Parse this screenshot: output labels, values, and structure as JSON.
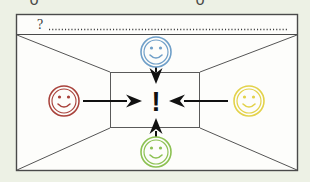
{
  "canvas": {
    "width": 310,
    "height": 182,
    "background_color": "#edf1e5",
    "paper_color": "#fdfdfb"
  },
  "diagram": {
    "title_fragment": "o    o",
    "type": "one-point-perspective-room",
    "frame": {
      "stroke_color": "#4a4a4a",
      "x": 16,
      "y": 14,
      "width": 282,
      "height": 157
    },
    "header_band": {
      "name": "question-header-band",
      "question_mark": "?",
      "dotted_line_char": ".",
      "dotted_line": "...........................................................................................",
      "y": 34
    },
    "inner_rect": {
      "x": 110,
      "y": 72,
      "width": 90,
      "height": 56,
      "stroke_color": "#5a5a5a"
    },
    "center_symbol": {
      "label": "!",
      "color": "#111111",
      "name": "exclamation-mark"
    },
    "faces": [
      {
        "id": "face-left",
        "position": "left",
        "color": "#a8413a",
        "label": "!",
        "cx": 64,
        "cy": 101,
        "r": 15,
        "expression": "smile"
      },
      {
        "id": "face-right",
        "position": "right",
        "color": "#e3d24a",
        "label": "!",
        "cx": 249,
        "cy": 101,
        "r": 15,
        "expression": "smile"
      },
      {
        "id": "face-top",
        "position": "top",
        "color": "#6f9fc8",
        "label": "!",
        "cx": 156,
        "cy": 52,
        "r": 15,
        "expression": "smile"
      },
      {
        "id": "face-bottom",
        "position": "bottom",
        "color": "#8cc152",
        "label": "!",
        "cx": 156,
        "cy": 152,
        "r": 15,
        "expression": "smile"
      }
    ],
    "arrows": [
      {
        "id": "arrow-left-to-center",
        "direction": "right",
        "color": "#111111"
      },
      {
        "id": "arrow-right-to-center",
        "direction": "left",
        "color": "#111111"
      },
      {
        "id": "arrow-top-to-center",
        "direction": "down",
        "color": "#111111"
      },
      {
        "id": "arrow-bottom-to-center",
        "direction": "up",
        "color": "#111111"
      }
    ]
  }
}
